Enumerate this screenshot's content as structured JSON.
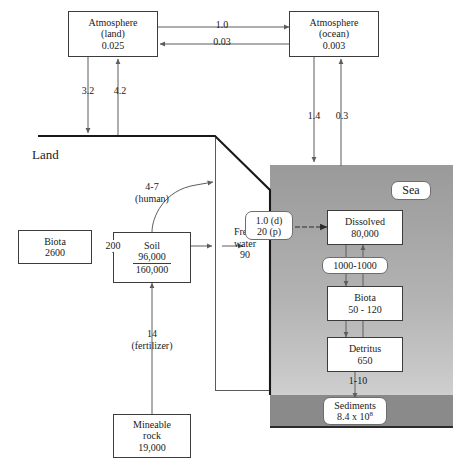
{
  "diagram": {
    "regions": {
      "land_label": "Land",
      "sea_label": "Sea"
    },
    "colors": {
      "sea_top": "#9a9a9a",
      "sea_bottom": "#cfcfcf",
      "sea_floor": "#8a8a8a",
      "box_border": "#3c3c3c",
      "line": "#5d5d5d",
      "coastline": "#181818",
      "background": "#ffffff",
      "text": "#1a1a1a"
    },
    "boxes": {
      "atmosphere_land": {
        "line1": "Atmosphere",
        "line2": "(land)",
        "value": "0.025"
      },
      "atmosphere_ocean": {
        "line1": "Atmosphere",
        "line2": "(ocean)",
        "value": "0.003"
      },
      "biota_land": {
        "line1": "Biota",
        "value": "2600"
      },
      "soil": {
        "line1": "Soil",
        "numerator": "96,000",
        "denominator": "160,000"
      },
      "mineable_rock": {
        "line1": "Mineable",
        "line2": "rock",
        "value": "19,000"
      },
      "dissolved": {
        "line1": "Dissolved",
        "value": "80,000"
      },
      "biota_sea": {
        "line1": "Biota",
        "value": "50 - 120"
      },
      "detritus": {
        "line1": "Detritus",
        "value": "650"
      }
    },
    "pills": {
      "sea": "Sea",
      "sediments": {
        "line1": "Sediments",
        "line2": "8.4 x 10",
        "exponent": "8"
      },
      "runoff": {
        "line1": "1.0 (d)",
        "line2": "20 (p)"
      },
      "exchange_1000": "1000-1000"
    },
    "flux_labels": {
      "atm_land_to_ocean": "1.0",
      "atm_ocean_to_land": "0.03",
      "land_to_atm": "4.2",
      "atm_to_land": "3.2",
      "atm_ocean_down": "1.4",
      "sea_to_atm_ocean": "0.3",
      "human": {
        "value": "4-7",
        "note": "(human)"
      },
      "fertilizer": {
        "value": "14",
        "note": "(fertilizer)"
      },
      "biota_soil_exchange": "200",
      "fresh_water": {
        "line1": "Fresh",
        "line2": "water",
        "value": "90"
      },
      "detritus_to_sediments": "1-10"
    }
  }
}
